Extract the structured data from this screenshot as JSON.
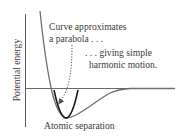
{
  "diagram": {
    "y_axis_label": "Potential energy",
    "x_axis_label": "Atomic separation",
    "annotation_1": {
      "line1": "Curve approximates",
      "line2": "a parabola . . ."
    },
    "annotation_2": {
      "line1": ". . . giving simple",
      "line2": "harmonic motion."
    },
    "colors": {
      "axes": "#5a5a5a",
      "potential_curve": "#6e6e6e",
      "parabola": "#1a1a1a",
      "arrow": "#555555",
      "text": "#3a3a3a"
    }
  }
}
